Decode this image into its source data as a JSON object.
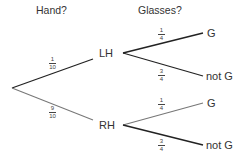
{
  "headers": {
    "hand": "Hand?",
    "glasses": "Glasses?"
  },
  "nodes": {
    "lh": "LH",
    "rh": "RH",
    "lh_g": "G",
    "lh_not_g": "not G",
    "rh_g": "G",
    "rh_not_g": "not G"
  },
  "probabilities": {
    "lh": {
      "num": "1",
      "den": "10"
    },
    "rh": {
      "num": "9",
      "den": "10"
    },
    "lh_g": {
      "num": "1",
      "den": "4"
    },
    "lh_not_g": {
      "num": "3",
      "den": "4"
    },
    "rh_g": {
      "num": "1",
      "den": "4"
    },
    "rh_not_g": {
      "num": "3",
      "den": "4"
    }
  },
  "colors": {
    "dark_branch": "#222222",
    "light_branch": "#777777"
  }
}
